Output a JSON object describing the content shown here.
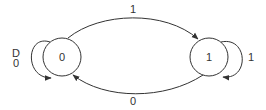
{
  "diagram": {
    "type": "state-machine",
    "colors": {
      "stroke": "#333333",
      "background": "#ffffff"
    },
    "states": [
      {
        "id": "s0",
        "label": "0"
      },
      {
        "id": "s1",
        "label": "1"
      }
    ],
    "transitions": [
      {
        "from": "s0",
        "to": "s1",
        "label": "1"
      },
      {
        "from": "s1",
        "to": "s0",
        "label": "0"
      },
      {
        "from": "s0",
        "to": "s0",
        "label_line1": "D",
        "label_line2": "0"
      },
      {
        "from": "s1",
        "to": "s1",
        "label": "1"
      }
    ]
  }
}
